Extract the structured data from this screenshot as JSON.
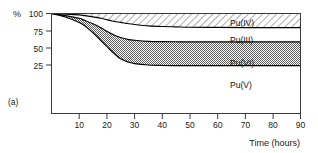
{
  "figure": {
    "panel_label": "(a)",
    "y_unit_label": "%",
    "x_axis_title": "Time (hours)"
  },
  "chart_data": {
    "type": "area",
    "title": "",
    "subtitle": "",
    "xlabel": "Time (hours)",
    "ylabel": "%",
    "xlim": [
      0,
      90
    ],
    "ylim": [
      0,
      100
    ],
    "grid": false,
    "legend_position": "inline-labels",
    "x_ticks": [
      10,
      20,
      30,
      40,
      50,
      60,
      70,
      80,
      90
    ],
    "y_ticks": [
      25,
      50,
      75,
      100
    ],
    "x": [
      0,
      5,
      10,
      12,
      15,
      18,
      20,
      22,
      25,
      28,
      30,
      35,
      40,
      45,
      50,
      60,
      70,
      80,
      90
    ],
    "series": [
      {
        "name": "Pu(IV)",
        "label": "Pu(IV)",
        "fill": "diagonal-hatch",
        "boundary_upper": [
          100,
          100,
          100,
          100,
          100,
          100,
          100,
          100,
          100,
          100,
          100,
          100,
          100,
          100,
          100,
          100,
          100,
          100,
          100
        ],
        "boundary_lower": [
          100,
          99,
          98,
          97,
          95,
          93,
          91,
          89,
          87,
          85,
          84,
          82,
          81,
          80.5,
          80,
          79.8,
          79.5,
          79.5,
          79.5
        ],
        "final_value": 79.5
      },
      {
        "name": "Pu(III)",
        "label": "Pu(III)",
        "fill": "white",
        "boundary_upper": [
          100,
          99,
          98,
          97,
          95,
          93,
          91,
          89,
          87,
          85,
          84,
          82,
          81,
          80.5,
          80,
          79.8,
          79.5,
          79.5,
          79.5
        ],
        "boundary_lower": [
          100,
          97,
          93,
          90,
          85,
          79,
          74,
          70,
          65,
          62,
          61,
          59.5,
          59,
          58.8,
          58.7,
          58.6,
          58.6,
          58.6,
          58.6
        ],
        "final_value": 58.6
      },
      {
        "name": "Pu(VI)",
        "label": "Pu(VI)",
        "fill": "dotted-checker",
        "boundary_upper": [
          100,
          97,
          93,
          90,
          85,
          79,
          74,
          70,
          65,
          62,
          61,
          59.5,
          59,
          58.8,
          58.7,
          58.6,
          58.6,
          58.6,
          58.6
        ],
        "boundary_lower": [
          100,
          95,
          87,
          82,
          72,
          60,
          52,
          44,
          34,
          29,
          27,
          25,
          24.3,
          24.1,
          24,
          24,
          24,
          24,
          24
        ],
        "final_value": 24.0
      },
      {
        "name": "Pu(V)",
        "label": "Pu(V)",
        "fill": "white",
        "boundary_upper": [
          100,
          95,
          87,
          82,
          72,
          60,
          52,
          44,
          34,
          29,
          27,
          25,
          24.3,
          24.1,
          24,
          24,
          24,
          24,
          24
        ],
        "boundary_lower": [
          0,
          0,
          0,
          0,
          0,
          0,
          0,
          0,
          0,
          0,
          0,
          0,
          0,
          0,
          0,
          0,
          0,
          0,
          0
        ],
        "final_value": 24.0
      }
    ],
    "annotations": [
      {
        "text": "Pu(IV)",
        "x": 72,
        "y": 90
      },
      {
        "text": "Pu(III)",
        "x": 72,
        "y": 69
      },
      {
        "text": "Pu(VI)",
        "x": 72,
        "y": 43
      },
      {
        "text": "Pu(V)",
        "x": 72,
        "y": 15
      }
    ]
  }
}
